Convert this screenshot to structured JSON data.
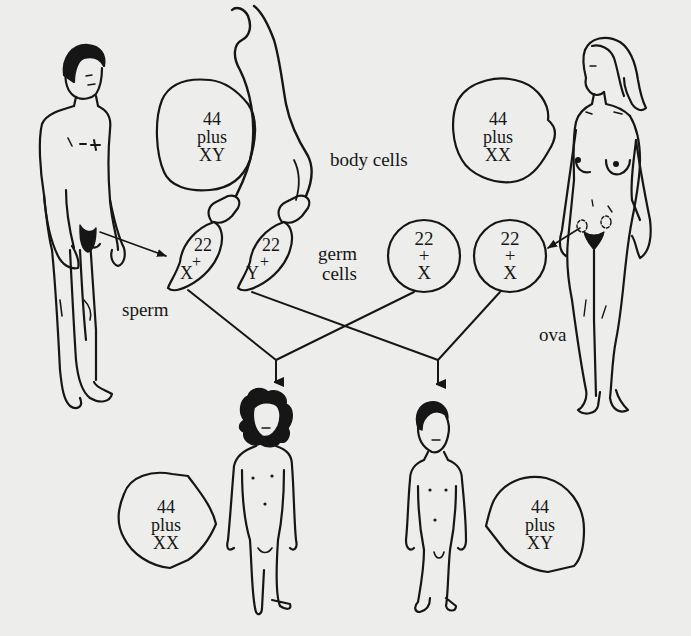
{
  "diagram": {
    "colors": {
      "ink": "#161616",
      "paper": "#ededeb"
    },
    "labels": {
      "body_cells": "body cells",
      "germ_cells_line1": "germ",
      "germ_cells_line2": "cells",
      "sperm": "sperm",
      "ova": "ova"
    },
    "figures": {
      "adult_male": {
        "label": "adult-male-figure"
      },
      "adult_female": {
        "label": "adult-female-figure"
      },
      "girl_child": {
        "label": "girl-child-figure"
      },
      "boy_child": {
        "label": "boy-child-figure"
      }
    },
    "body_cells": {
      "male": {
        "line1": "44",
        "line2": "plus",
        "line3": "XY"
      },
      "female": {
        "line1": "44",
        "line2": "plus",
        "line3": "XX"
      }
    },
    "sperm_cells": [
      {
        "autosomes": "22",
        "plus": "+",
        "sex": "X"
      },
      {
        "autosomes": "22",
        "plus": "+",
        "sex": "Y"
      }
    ],
    "ova_cells": [
      {
        "autosomes": "22",
        "plus": "+",
        "sex": "X"
      },
      {
        "autosomes": "22",
        "plus": "+",
        "sex": "X"
      }
    ],
    "offspring_cells": {
      "girl": {
        "line1": "44",
        "line2": "plus",
        "line3": "XX"
      },
      "boy": {
        "line1": "44",
        "line2": "plus",
        "line3": "XY"
      }
    }
  }
}
